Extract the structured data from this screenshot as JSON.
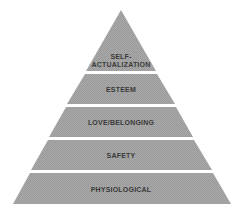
{
  "diagram": {
    "type": "pyramid",
    "fill_color": "#a3a3a3",
    "text_color": "#3a3a3a",
    "background": "#ffffff",
    "levels": [
      {
        "label_line1": "SELF-",
        "label_line2": "ACTUALIZATION"
      },
      {
        "label": "ESTEEM"
      },
      {
        "label": "LOVE/BELONGING"
      },
      {
        "label": "SAFETY"
      },
      {
        "label": "PHYSIOLOGICAL"
      }
    ]
  }
}
